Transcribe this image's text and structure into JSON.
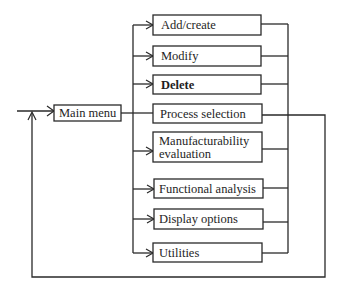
{
  "diagram": {
    "type": "menu-flow",
    "main_menu": {
      "label": "Main menu"
    },
    "options": [
      {
        "label": "Add/create"
      },
      {
        "label": "Modify"
      },
      {
        "label": "Delete"
      },
      {
        "label": "Process selection"
      },
      {
        "label_line1": "Manufacturability",
        "label_line2": "evaluation"
      },
      {
        "label": "Functional analysis"
      },
      {
        "label": "Display options"
      },
      {
        "label": "Utilities"
      }
    ],
    "colors": {
      "stroke": "#2a2a2a",
      "background": "#ffffff",
      "text": "#1e1e1e"
    }
  }
}
